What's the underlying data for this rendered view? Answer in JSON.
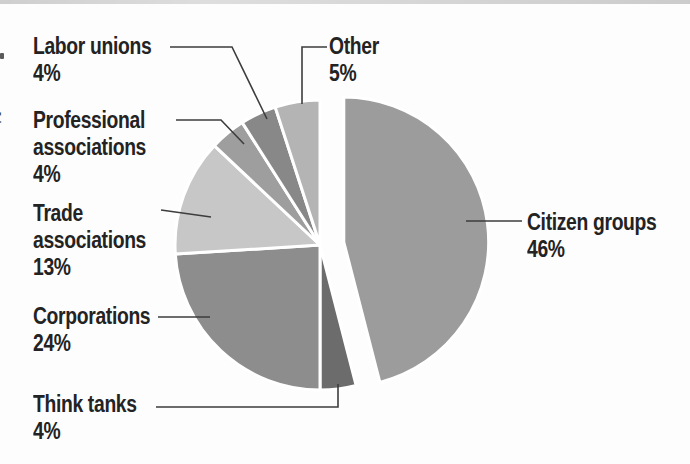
{
  "figure": {
    "description_role": "pie-chart-figure"
  },
  "colors": {
    "background": "#fdfdfd",
    "leader_line": "#3d3d3d",
    "label_text": "#232323",
    "scan_edge": "#d2d2d2",
    "slice_stroke": "#ffffff"
  },
  "chart_data": {
    "type": "pie",
    "title": "",
    "legend": "none",
    "start_angle_deg": 0,
    "direction": "clockwise",
    "labels_shown_with_percent": true,
    "slices": [
      {
        "label": "Citizen groups",
        "value": 46,
        "color": "#9c9c9c",
        "exploded": true
      },
      {
        "label": "Think tanks",
        "value": 4,
        "color": "#6c6c6c",
        "exploded": false
      },
      {
        "label": "Corporations",
        "value": 24,
        "color": "#8d8d8d",
        "exploded": false
      },
      {
        "label": "Trade associations",
        "value": 13,
        "color": "#c7c7c7",
        "exploded": false
      },
      {
        "label": "Professional associations",
        "value": 4,
        "color": "#9e9e9e",
        "exploded": false
      },
      {
        "label": "Labor unions",
        "value": 4,
        "color": "#888888",
        "exploded": false
      },
      {
        "label": "Other",
        "value": 5,
        "color": "#b4b4b4",
        "exploded": false
      }
    ]
  },
  "callouts": {
    "labor_unions": {
      "lines": [
        "Labor unions",
        "4%"
      ]
    },
    "professional": {
      "lines": [
        "Professional",
        "associations",
        "4%"
      ]
    },
    "trade": {
      "lines": [
        "Trade",
        "associations",
        "13%"
      ]
    },
    "corporations": {
      "lines": [
        "Corporations",
        "24%"
      ]
    },
    "think_tanks": {
      "lines": [
        "Think tanks",
        "4%"
      ]
    },
    "citizen_groups": {
      "lines": [
        "Citizen groups",
        "46%"
      ]
    },
    "other": {
      "lines": [
        "Other",
        "5%"
      ]
    }
  },
  "page_edge": {
    "fragment_glyph": "c"
  }
}
